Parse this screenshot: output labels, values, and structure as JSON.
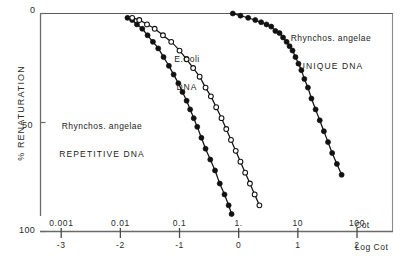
{
  "chart_data": {
    "type": "scatter",
    "title": "",
    "xlabel": "Cot",
    "xlabel_secondary": "Log Cot",
    "ylabel": "% RENATURATION",
    "ylim": [
      0,
      100
    ],
    "y_inverted": true,
    "ytick_labels": [
      "0",
      "50",
      "100"
    ],
    "ytick_values": [
      0,
      50,
      100
    ],
    "xlim": [
      -3.35,
      2.6
    ],
    "xtick_labels": [
      "0.001",
      "0.01",
      "0.1",
      "1.",
      "10",
      "100"
    ],
    "xtick_labels_secondary": [
      "-3",
      "-2",
      "-1",
      "0",
      "1",
      "2"
    ],
    "xtick_values": [
      -3,
      -2,
      -1,
      0,
      1,
      2
    ],
    "grid": false,
    "legend": "inline-annotations",
    "series": [
      {
        "name": "Rhynchos. angelae REPETITIVE DNA",
        "label_line1": "Rhynchos. angelae",
        "label_line2": "REPETITIVE DNA",
        "marker": "filled-circle",
        "color": "#111111",
        "points": [
          [
            -1.88,
            2
          ],
          [
            -1.8,
            3
          ],
          [
            -1.72,
            5
          ],
          [
            -1.63,
            7
          ],
          [
            -1.54,
            10
          ],
          [
            -1.45,
            13
          ],
          [
            -1.36,
            16
          ],
          [
            -1.27,
            20
          ],
          [
            -1.18,
            24
          ],
          [
            -1.1,
            28
          ],
          [
            -1.02,
            32
          ],
          [
            -0.95,
            36
          ],
          [
            -0.88,
            40
          ],
          [
            -0.82,
            44
          ],
          [
            -0.76,
            48
          ],
          [
            -0.7,
            52
          ],
          [
            -0.63,
            57
          ],
          [
            -0.56,
            62
          ],
          [
            -0.48,
            67
          ],
          [
            -0.4,
            72
          ],
          [
            -0.32,
            78
          ],
          [
            -0.24,
            83
          ],
          [
            -0.17,
            88
          ],
          [
            -0.12,
            92
          ]
        ]
      },
      {
        "name": "E.Coli DNA",
        "label_line1": "E.Coli",
        "label_line2": "DNA",
        "marker": "open-circle",
        "color": "#111111",
        "points": [
          [
            -1.8,
            2
          ],
          [
            -1.68,
            3
          ],
          [
            -1.55,
            5
          ],
          [
            -1.42,
            7
          ],
          [
            -1.28,
            10
          ],
          [
            -1.14,
            13
          ],
          [
            -1.0,
            17
          ],
          [
            -0.88,
            21
          ],
          [
            -0.77,
            25
          ],
          [
            -0.66,
            29
          ],
          [
            -0.56,
            34
          ],
          [
            -0.47,
            38
          ],
          [
            -0.38,
            43
          ],
          [
            -0.29,
            48
          ],
          [
            -0.21,
            53
          ],
          [
            -0.13,
            58
          ],
          [
            -0.05,
            63
          ],
          [
            0.03,
            68
          ],
          [
            0.11,
            73
          ],
          [
            0.19,
            78
          ],
          [
            0.27,
            83
          ],
          [
            0.35,
            88
          ]
        ]
      },
      {
        "name": "Rhynchos. angelae UNIQUE DNA",
        "label_line1": "Rhynchos. angelae",
        "label_line2": "UNIQUE DNA",
        "marker": "filled-circle",
        "color": "#111111",
        "points": [
          [
            -0.1,
            0
          ],
          [
            0.03,
            1
          ],
          [
            0.16,
            2
          ],
          [
            0.28,
            3
          ],
          [
            0.38,
            4
          ],
          [
            0.47,
            5
          ],
          [
            0.55,
            6
          ],
          [
            0.62,
            8
          ],
          [
            0.69,
            9
          ],
          [
            0.75,
            11
          ],
          [
            0.81,
            13
          ],
          [
            0.86,
            15
          ],
          [
            0.91,
            17
          ],
          [
            0.96,
            20
          ],
          [
            1.01,
            23
          ],
          [
            1.06,
            26
          ],
          [
            1.11,
            30
          ],
          [
            1.17,
            34
          ],
          [
            1.23,
            39
          ],
          [
            1.3,
            44
          ],
          [
            1.37,
            49
          ],
          [
            1.44,
            54
          ],
          [
            1.51,
            59
          ],
          [
            1.58,
            64
          ],
          [
            1.66,
            69
          ],
          [
            1.74,
            74
          ]
        ]
      }
    ]
  },
  "axes": {
    "y_title": "% RENATURATION",
    "y_top": "0",
    "y_mid": "50",
    "y_bottom": "100",
    "x_row_top": [
      "0.001",
      "0.01",
      "0.1",
      "1.",
      "10",
      "100"
    ],
    "x_row_bottom": [
      "-3",
      "-2",
      "-1",
      "0",
      "1",
      "2"
    ],
    "x_name_top": "Cot",
    "x_name_bottom": "Log Cot"
  }
}
